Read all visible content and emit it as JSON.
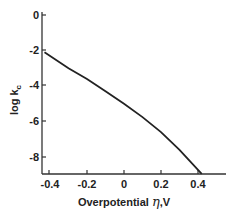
{
  "chart_data": {
    "type": "line",
    "title": "",
    "xlabel": "Overpotential η,V",
    "xlabel_text": "Overpotential ",
    "xlabel_symbol": "η",
    "xlabel_unit": ",V",
    "ylabel": "log k_c",
    "ylabel_main": "log k",
    "ylabel_sub": "c",
    "xlim": [
      -0.43,
      0.55
    ],
    "ylim": [
      -9,
      0.5
    ],
    "xticks": [
      -0.4,
      -0.2,
      0,
      0.2,
      0.4
    ],
    "xtick_labels": [
      "-0.4",
      "-0.2",
      "0",
      "0.2",
      "0.4"
    ],
    "yticks": [
      0,
      -2,
      -4,
      -6,
      -8
    ],
    "ytick_labels": [
      "0",
      "-2",
      "-4",
      "-6",
      "-8"
    ],
    "grid": false,
    "legend": null,
    "series": [
      {
        "name": "log k_c",
        "color": "#222222",
        "x": [
          -0.43,
          -0.3,
          -0.2,
          -0.1,
          0.0,
          0.1,
          0.2,
          0.3,
          0.42
        ],
        "y": [
          -2.1,
          -3.0,
          -3.6,
          -4.3,
          -5.0,
          -5.75,
          -6.6,
          -7.6,
          -8.95
        ]
      }
    ]
  }
}
